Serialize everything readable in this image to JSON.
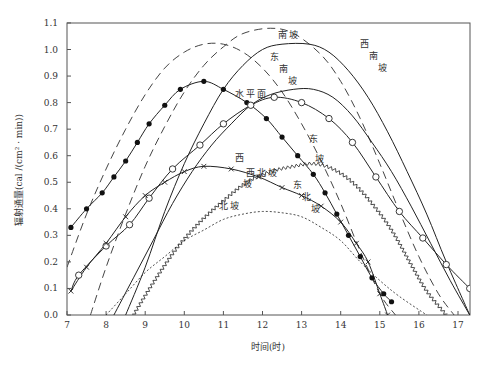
{
  "chart_data": {
    "type": "line",
    "title": "",
    "xlabel": "时间(时)",
    "ylabel": "辐射通量(cal /(cm² · min))",
    "xlim": [
      7,
      17.3
    ],
    "ylim": [
      0.0,
      1.1
    ],
    "x_ticks": [
      7,
      8,
      9,
      10,
      11,
      12,
      13,
      14,
      15,
      16,
      17
    ],
    "y_ticks": [
      "0.0",
      "0.1",
      "0.2",
      "0.3",
      "0.4",
      "0.5",
      "0.6",
      "0.7",
      "0.8",
      "0.9",
      "1.0",
      "1.1"
    ],
    "grid": false,
    "legend": "inline labels",
    "series": [
      {
        "name": "南坡",
        "style": "dashed-long",
        "points": [
          [
            7.6,
            0.0
          ],
          [
            8.0,
            0.18
          ],
          [
            8.5,
            0.38
          ],
          [
            9,
            0.56
          ],
          [
            9.5,
            0.71
          ],
          [
            10,
            0.84
          ],
          [
            10.5,
            0.94
          ],
          [
            11,
            1.01
          ],
          [
            11.5,
            1.06
          ],
          [
            12.2,
            1.08
          ],
          [
            12.8,
            1.06
          ],
          [
            13.5,
            0.98
          ],
          [
            14,
            0.88
          ],
          [
            14.5,
            0.74
          ],
          [
            15,
            0.57
          ],
          [
            15.5,
            0.39
          ],
          [
            16,
            0.22
          ],
          [
            16.5,
            0.08
          ],
          [
            16.9,
            0.0
          ]
        ],
        "label_pos": [
          12.5,
          1.045
        ]
      },
      {
        "name": "东南坡",
        "style": "dashed-long",
        "points": [
          [
            7.0,
            0.18
          ],
          [
            7.5,
            0.38
          ],
          [
            8,
            0.55
          ],
          [
            8.5,
            0.7
          ],
          [
            9,
            0.83
          ],
          [
            9.5,
            0.93
          ],
          [
            10,
            0.99
          ],
          [
            10.5,
            1.02
          ],
          [
            11,
            1.02
          ],
          [
            11.5,
            0.99
          ],
          [
            12,
            0.93
          ],
          [
            12.5,
            0.84
          ],
          [
            13,
            0.72
          ],
          [
            13.5,
            0.58
          ],
          [
            14,
            0.42
          ],
          [
            14.5,
            0.24
          ],
          [
            15,
            0.08
          ],
          [
            15.4,
            0.0
          ]
        ],
        "label_pos": [
          12.3,
          0.96
        ]
      },
      {
        "name": "西南坡",
        "style": "solid",
        "points": [
          [
            8.5,
            0.0
          ],
          [
            9,
            0.18
          ],
          [
            9.5,
            0.39
          ],
          [
            10,
            0.57
          ],
          [
            10.5,
            0.72
          ],
          [
            11,
            0.85
          ],
          [
            11.5,
            0.94
          ],
          [
            12,
            1.0
          ],
          [
            12.5,
            1.02
          ],
          [
            13.2,
            1.02
          ],
          [
            13.7,
            0.99
          ],
          [
            14.2,
            0.92
          ],
          [
            14.7,
            0.82
          ],
          [
            15.2,
            0.69
          ],
          [
            15.7,
            0.54
          ],
          [
            16.2,
            0.38
          ],
          [
            16.7,
            0.2
          ],
          [
            17.3,
            0.0
          ]
        ],
        "label_pos": [
          14.6,
          1.01
        ]
      },
      {
        "name": "东坡",
        "style": "solid-filled-circle",
        "points": [
          [
            7.1,
            0.33
          ],
          [
            7.5,
            0.4
          ],
          [
            7.9,
            0.46
          ],
          [
            8.2,
            0.52
          ],
          [
            8.5,
            0.58
          ],
          [
            8.8,
            0.65
          ],
          [
            9.1,
            0.72
          ],
          [
            9.5,
            0.79
          ],
          [
            9.9,
            0.85
          ],
          [
            10.5,
            0.88
          ],
          [
            11.0,
            0.85
          ],
          [
            11.6,
            0.8
          ],
          [
            12.1,
            0.74
          ],
          [
            12.5,
            0.67
          ],
          [
            12.9,
            0.6
          ],
          [
            13.3,
            0.53
          ],
          [
            13.6,
            0.46
          ],
          [
            13.9,
            0.38
          ],
          [
            14.2,
            0.3
          ],
          [
            14.5,
            0.22
          ],
          [
            14.8,
            0.14
          ],
          [
            15.1,
            0.08
          ],
          [
            15.3,
            0.05
          ]
        ],
        "label_pos": [
          13.3,
          0.65
        ]
      },
      {
        "name": "水平面",
        "style": "solid-open-circle",
        "points": [
          [
            7.1,
            0.09
          ],
          [
            7.3,
            0.15
          ],
          [
            8.0,
            0.26
          ],
          [
            8.6,
            0.34
          ],
          [
            9.1,
            0.44
          ],
          [
            9.7,
            0.55
          ],
          [
            10.4,
            0.64
          ],
          [
            11.0,
            0.72
          ],
          [
            11.7,
            0.79
          ],
          [
            12.3,
            0.82
          ],
          [
            13.0,
            0.8
          ],
          [
            13.7,
            0.74
          ],
          [
            14.3,
            0.65
          ],
          [
            14.9,
            0.52
          ],
          [
            15.5,
            0.39
          ],
          [
            16.1,
            0.29
          ],
          [
            16.7,
            0.19
          ],
          [
            17.3,
            0.1
          ]
        ],
        "label_pos": [
          11.4,
          0.82
        ]
      },
      {
        "name": "西坡",
        "style": "solid",
        "points": [
          [
            8.2,
            0.0
          ],
          [
            8.7,
            0.14
          ],
          [
            9.2,
            0.28
          ],
          [
            9.7,
            0.42
          ],
          [
            10.2,
            0.54
          ],
          [
            10.7,
            0.64
          ],
          [
            11.2,
            0.72
          ],
          [
            11.7,
            0.79
          ],
          [
            12.2,
            0.83
          ],
          [
            12.8,
            0.85
          ],
          [
            13.3,
            0.85
          ],
          [
            13.8,
            0.82
          ],
          [
            14.3,
            0.75
          ],
          [
            14.8,
            0.65
          ],
          [
            15.3,
            0.54
          ],
          [
            15.8,
            0.41
          ],
          [
            16.3,
            0.27
          ],
          [
            16.8,
            0.13
          ],
          [
            17.3,
            0.0
          ]
        ],
        "label_pos": [
          11.4,
          0.58
        ]
      },
      {
        "name": "东北坡",
        "style": "solid-x-marker",
        "points": [
          [
            7.1,
            0.09
          ],
          [
            7.5,
            0.18
          ],
          [
            8.0,
            0.27
          ],
          [
            8.5,
            0.37
          ],
          [
            9.0,
            0.45
          ],
          [
            9.5,
            0.5
          ],
          [
            10.0,
            0.54
          ],
          [
            10.5,
            0.56
          ],
          [
            11.2,
            0.55
          ],
          [
            11.9,
            0.52
          ],
          [
            12.5,
            0.48
          ],
          [
            13.0,
            0.45
          ],
          [
            13.5,
            0.41
          ],
          [
            14.0,
            0.35
          ],
          [
            14.4,
            0.27
          ],
          [
            14.7,
            0.2
          ],
          [
            15.0,
            0.08
          ],
          [
            15.2,
            0.0
          ]
        ],
        "label_pos": [
          12.9,
          0.48
        ]
      },
      {
        "name": "西北坡",
        "style": "wavy",
        "points": [
          [
            8.7,
            0.0
          ],
          [
            9.2,
            0.12
          ],
          [
            9.8,
            0.25
          ],
          [
            10.4,
            0.35
          ],
          [
            11.0,
            0.43
          ],
          [
            11.6,
            0.5
          ],
          [
            12.2,
            0.54
          ],
          [
            12.8,
            0.56
          ],
          [
            13.3,
            0.57
          ],
          [
            13.8,
            0.55
          ],
          [
            14.3,
            0.5
          ],
          [
            14.8,
            0.42
          ],
          [
            15.3,
            0.32
          ],
          [
            15.8,
            0.19
          ],
          [
            16.2,
            0.09
          ],
          [
            16.7,
            0.0
          ]
        ],
        "label_pos": [
          11.7,
          0.525
        ]
      },
      {
        "name": "北坡",
        "style": "dotted",
        "points": [
          [
            8.0,
            0.0
          ],
          [
            8.5,
            0.08
          ],
          [
            9.0,
            0.16
          ],
          [
            9.5,
            0.22
          ],
          [
            10.0,
            0.28
          ],
          [
            10.5,
            0.32
          ],
          [
            11.0,
            0.36
          ],
          [
            11.5,
            0.38
          ],
          [
            12.0,
            0.39
          ],
          [
            12.5,
            0.385
          ],
          [
            13.0,
            0.37
          ],
          [
            13.5,
            0.33
          ],
          [
            14.0,
            0.28
          ],
          [
            14.5,
            0.2
          ],
          [
            15.0,
            0.13
          ],
          [
            15.5,
            0.07
          ],
          [
            16.2,
            0.0
          ]
        ],
        "label_pos": [
          11.0,
          0.4
        ]
      }
    ]
  },
  "axes": {
    "xlabel": "时间(时)",
    "ylabel": "辐射通量(cal /(cm² · min))"
  }
}
